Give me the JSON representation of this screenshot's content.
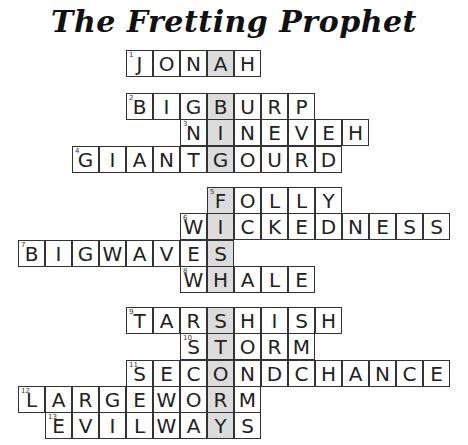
{
  "title": "The Fretting Prophet",
  "colors": {
    "highlight": "#dcdcdc",
    "border": "#333333",
    "text": "#222222"
  },
  "grid": {
    "origin_x": 19,
    "cell_size": 27,
    "highlight_col": 7,
    "hidden_word": "JBIGFISHSTORY"
  },
  "entries": [
    {
      "num": "1",
      "answer": "JONAH",
      "start_col": 4,
      "top": 50
    },
    {
      "num": "2",
      "answer": "BIGBURP",
      "start_col": 4,
      "top": 93
    },
    {
      "num": "3",
      "answer": "NINEVEH",
      "start_col": 6,
      "top": 119
    },
    {
      "num": "4",
      "answer": "GIANTGOURD",
      "start_col": 2,
      "top": 146
    },
    {
      "num": "5",
      "answer": "FOLLY",
      "start_col": 7,
      "top": 187
    },
    {
      "num": "6",
      "answer": "WICKEDNESS",
      "start_col": 6,
      "top": 213
    },
    {
      "num": "7",
      "answer": "BIGWAVES",
      "start_col": 0,
      "top": 240
    },
    {
      "num": "8",
      "answer": "WHALE",
      "start_col": 6,
      "top": 266
    },
    {
      "num": "9",
      "answer": "TARSHISH",
      "start_col": 4,
      "top": 307
    },
    {
      "num": "10",
      "answer": "STORM",
      "start_col": 6,
      "top": 333
    },
    {
      "num": "11",
      "answer": "SECONDCHANCE",
      "start_col": 4,
      "top": 360
    },
    {
      "num": "12",
      "answer": "LARGEWORM",
      "start_col": 0,
      "top": 386
    },
    {
      "num": "13",
      "answer": "EVILWAYS",
      "start_col": 1,
      "top": 412
    }
  ]
}
